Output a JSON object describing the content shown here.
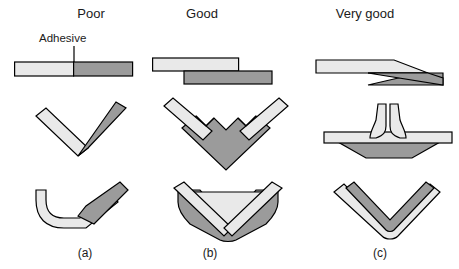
{
  "figure": {
    "title_row": {
      "poor": "Poor",
      "good": "Good",
      "very_good": "Very good"
    },
    "captions": {
      "a": "(a)",
      "b": "(b)",
      "c": "(c)"
    },
    "annotations": {
      "adhesive": "Adhesive"
    },
    "colors": {
      "light_part": "#e9e9e9",
      "dark_part": "#9b9b9b",
      "outline": "#000000",
      "background": "#ffffff",
      "text": "#1a1a1a"
    },
    "rows": [
      {
        "row_index": 1,
        "joint_family": "flat-plate-joint",
        "cells": [
          {
            "column": "Poor",
            "joint_name": "butt-joint",
            "icon": "butt-joint-icon"
          },
          {
            "column": "Good",
            "joint_name": "lap-joint",
            "icon": "lap-joint-icon"
          },
          {
            "column": "Very good",
            "joint_name": "scarf-joint",
            "icon": "scarf-joint-icon"
          }
        ]
      },
      {
        "row_index": 2,
        "joint_family": "angle-joint",
        "cells": [
          {
            "column": "Poor",
            "joint_name": "angle-butt-joint",
            "icon": "angle-butt-joint-icon"
          },
          {
            "column": "Good",
            "joint_name": "socketed-vee-block-joint",
            "icon": "vee-block-joint-icon"
          },
          {
            "column": "Very good",
            "joint_name": "tee-joint-with-fillet",
            "icon": "tee-fillet-joint-icon"
          }
        ]
      },
      {
        "row_index": 3,
        "joint_family": "formed-corner-joint",
        "cells": [
          {
            "column": "Poor",
            "joint_name": "bent-strip-lap-joint",
            "icon": "bent-strip-lap-icon"
          },
          {
            "column": "Good",
            "joint_name": "vee-channel-joint",
            "icon": "vee-channel-joint-icon"
          },
          {
            "column": "Very good",
            "joint_name": "nested-vee-joint",
            "icon": "nested-vee-joint-icon"
          }
        ]
      }
    ]
  }
}
